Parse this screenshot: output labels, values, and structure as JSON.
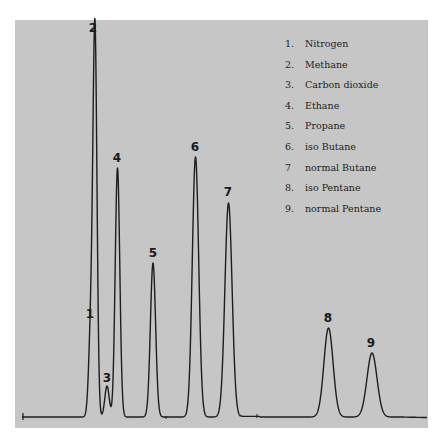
{
  "chart_data": {
    "type": "line",
    "title": "",
    "xlabel": "",
    "ylabel": "",
    "grid": false,
    "legend_position": "top-right",
    "baseline_y_px": 417,
    "peaks": [
      {
        "id": "1",
        "name": "Nitrogen",
        "x_px": 91,
        "apex_y_px": 325,
        "width_px": 2.2
      },
      {
        "id": "2",
        "name": "Methane",
        "x_px": 95,
        "apex_y_px": 37,
        "width_px": 2.0
      },
      {
        "id": "3",
        "name": "Carbon dioxide",
        "x_px": 107,
        "apex_y_px": 386,
        "width_px": 2.2
      },
      {
        "id": "4",
        "name": "Ethane",
        "x_px": 117.5,
        "apex_y_px": 168,
        "width_px": 2.3
      },
      {
        "id": "5",
        "name": "Propane",
        "x_px": 153,
        "apex_y_px": 263,
        "width_px": 2.6
      },
      {
        "id": "6",
        "name": "iso Butane",
        "x_px": 195.5,
        "apex_y_px": 157,
        "width_px": 3.2
      },
      {
        "id": "7",
        "name": "normal Butane",
        "x_px": 228.5,
        "apex_y_px": 203,
        "width_px": 3.6
      },
      {
        "id": "8",
        "name": "iso Pentane",
        "x_px": 328.5,
        "apex_y_px": 328,
        "width_px": 4.6
      },
      {
        "id": "9",
        "name": "normal Pentane",
        "x_px": 372,
        "apex_y_px": 353,
        "width_px": 5.0
      }
    ],
    "relative_heights": [
      92,
      380,
      31,
      249,
      154,
      260,
      214,
      89,
      64
    ]
  },
  "legend": {
    "items": [
      {
        "num": "1.",
        "label": "Nitrogen"
      },
      {
        "num": "2.",
        "label": "Methane"
      },
      {
        "num": "3.",
        "label": "Carbon dioxide"
      },
      {
        "num": "4.",
        "label": "Ethane"
      },
      {
        "num": "5.",
        "label": "Propane"
      },
      {
        "num": "6.",
        "label": "iso Butane"
      },
      {
        "num": "7",
        "label": "normal Butane"
      },
      {
        "num": "8.",
        "label": "iso Pentane"
      },
      {
        "num": "9.",
        "label": "normal Pentane"
      }
    ]
  },
  "peak_labels": [
    {
      "text": "1",
      "x": 90,
      "y": 308
    },
    {
      "text": "2",
      "x": 93,
      "y": 22
    },
    {
      "text": "3",
      "x": 107,
      "y": 372
    },
    {
      "text": "4",
      "x": 117,
      "y": 152
    },
    {
      "text": "5",
      "x": 153,
      "y": 247
    },
    {
      "text": "6",
      "x": 195,
      "y": 141
    },
    {
      "text": "7",
      "x": 228,
      "y": 186
    },
    {
      "text": "8",
      "x": 328,
      "y": 312
    },
    {
      "text": "9",
      "x": 371,
      "y": 337
    }
  ],
  "colors": {
    "panel": "#c6c6c6",
    "trace": "#1e1e1e",
    "page": "#ffffff"
  }
}
